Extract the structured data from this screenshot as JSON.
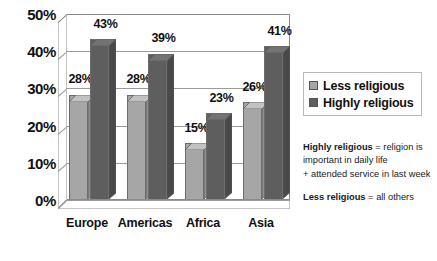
{
  "chart_data": {
    "type": "bar",
    "title": "",
    "xlabel": "",
    "ylabel": "",
    "ylim": [
      0,
      50
    ],
    "grid": true,
    "legend_position": "right",
    "categories": [
      "Europe",
      "Americas",
      "Africa",
      "Asia"
    ],
    "ytick_labels": [
      "50%",
      "40%",
      "30%",
      "20%",
      "10%",
      "0%"
    ],
    "ytick_values": [
      50,
      40,
      30,
      20,
      10,
      0
    ],
    "series": [
      {
        "name": "Less religious",
        "color": "#a6a6a6",
        "values": [
          28,
          28,
          15,
          26
        ],
        "labels": [
          "28%",
          "28%",
          "15%",
          "26%"
        ]
      },
      {
        "name": "Highly religious",
        "color": "#5e5e5e",
        "values": [
          43,
          39,
          23,
          41
        ],
        "labels": [
          "43%",
          "39%",
          "23%",
          "41%"
        ]
      }
    ]
  },
  "legend": {
    "items": [
      {
        "label": "Less religious",
        "swatch": "light"
      },
      {
        "label": "Highly religious",
        "swatch": "dark"
      }
    ]
  },
  "notes": {
    "block1": {
      "term": "Highly religious",
      "line1_rest": " = religion is",
      "line2": "important in daily life",
      "line3": "+ attended service in last week"
    },
    "block2": {
      "term": "Less religious",
      "rest": " = all others"
    }
  }
}
